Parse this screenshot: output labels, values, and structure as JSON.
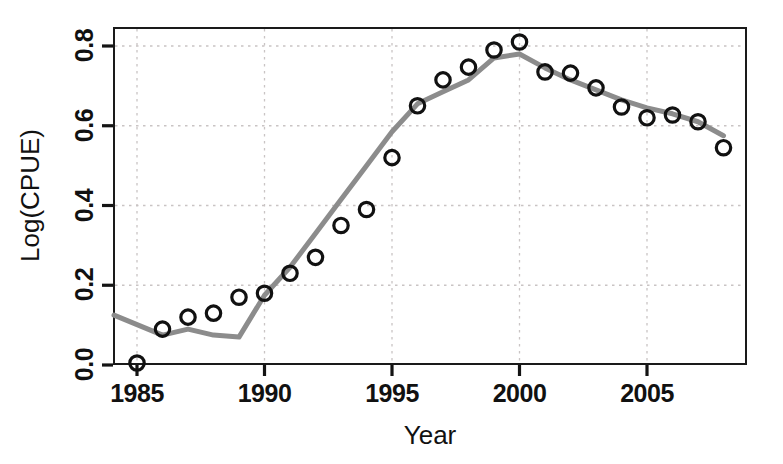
{
  "chart_data": {
    "type": "scatter",
    "title": "",
    "xlabel": "Year",
    "ylabel": "Log(CPUE)",
    "xlim": [
      1984.1,
      1984.1
    ],
    "ylim": [
      0.0,
      0.85
    ],
    "grid": true,
    "legend": null,
    "x_ticks": [
      "1985",
      "1990",
      "1995",
      "2000",
      "2005"
    ],
    "x_tick_values": [
      1985,
      1990,
      1995,
      2000,
      2005
    ],
    "y_ticks": [
      "0.0",
      "0.2",
      "0.4",
      "0.6",
      "0.8"
    ],
    "y_tick_values": [
      0.0,
      0.2,
      0.4,
      0.6,
      0.8
    ],
    "x": [
      1985,
      1986,
      1987,
      1988,
      1989,
      1990,
      1991,
      1992,
      1993,
      1994,
      1995,
      1996,
      1997,
      1998,
      1999,
      2000,
      2001,
      2002,
      2003,
      2004,
      2005,
      2006,
      2007,
      2008
    ],
    "series": [
      {
        "name": "Observed",
        "marker": "open-circle",
        "color": "#111111",
        "values": [
          0.005,
          0.09,
          0.12,
          0.13,
          0.17,
          0.18,
          0.23,
          0.27,
          0.35,
          0.39,
          0.52,
          0.65,
          0.715,
          0.747,
          0.79,
          0.81,
          0.735,
          0.732,
          0.695,
          0.647,
          0.62,
          0.627,
          0.61,
          0.545
        ]
      },
      {
        "name": "Fitted",
        "marker": "none",
        "color": "#8c8c8c",
        "values": [
          0.125,
          0.075,
          0.09,
          0.075,
          0.07,
          0.175,
          0.245,
          0.33,
          0.415,
          0.5,
          0.585,
          0.655,
          0.685,
          0.715,
          0.77,
          0.78,
          0.745,
          0.715,
          0.69,
          0.665,
          0.645,
          0.63,
          0.61,
          0.575
        ]
      }
    ]
  },
  "axis": {
    "x_title": "Year",
    "y_title": "Log(CPUE)"
  }
}
